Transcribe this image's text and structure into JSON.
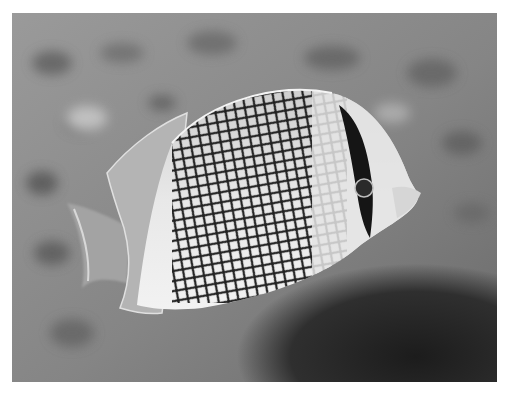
{
  "image": {
    "subject": "butterflyfish",
    "style": "grayscale photograph",
    "background": "blurred coral reef",
    "colors": {
      "border": "#ffffff",
      "background_mid": "#8a8a8a",
      "background_dark": "#2e2e2e",
      "body_light": "#e6e6e6",
      "pattern_dark": "#1e1e1e"
    }
  }
}
